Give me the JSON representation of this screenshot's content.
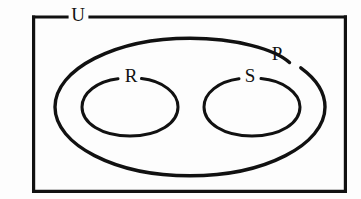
{
  "diagram": {
    "type": "euler-venn-diagram",
    "background_color": "#fdfdfd",
    "line_color": "#111111",
    "labels": {
      "universe": "U",
      "outer_set": "P",
      "left_subset": "R",
      "right_subset": "S"
    },
    "shapes": {
      "universe_rectangle": {
        "name": "U",
        "x": 32,
        "y": 17,
        "width": 315,
        "height": 176
      },
      "outer_ellipse": {
        "name": "P",
        "cx": 190,
        "cy": 107,
        "rx": 135,
        "ry": 69
      },
      "left_ellipse": {
        "name": "R",
        "cx": 130,
        "cy": 107,
        "rx": 48,
        "ry": 29
      },
      "right_ellipse": {
        "name": "S",
        "cx": 252,
        "cy": 107,
        "rx": 48,
        "ry": 29
      }
    },
    "label_positions": {
      "universe": {
        "x": 78,
        "y": 16
      },
      "outer_set": {
        "x": 277,
        "y": 55
      },
      "left_subset": {
        "x": 131,
        "y": 77
      },
      "right_subset": {
        "x": 250,
        "y": 77
      }
    },
    "relations": "R and S are disjoint subsets contained in P, and P is contained in the universal set U"
  }
}
